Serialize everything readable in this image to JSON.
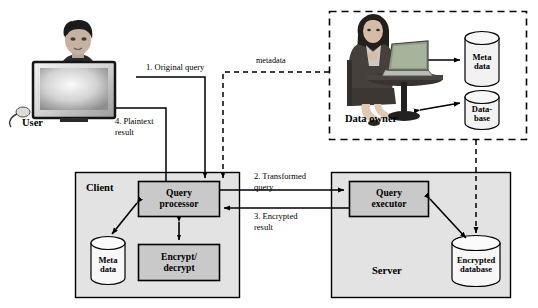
{
  "diagram": {
    "colors": {
      "zone_fill": "#e3e3e3",
      "component_fill": "#c9c9c9",
      "cylinder_fill": "#f2f2f2",
      "stroke": "#000000",
      "background": "#ffffff"
    },
    "actors": {
      "user": {
        "label": "User",
        "icon": "user-at-desktop-photo"
      },
      "data_owner": {
        "label": "Data owner",
        "icon": "woman-with-laptop-photo"
      }
    },
    "zones": [
      {
        "id": "data-owner-zone",
        "label": "",
        "border": "dashed"
      },
      {
        "id": "client-zone",
        "label": "Client",
        "border": "solid"
      },
      {
        "id": "server-zone",
        "label": "Server",
        "border": "solid"
      }
    ],
    "components": [
      {
        "id": "query-processor",
        "label": "Query\nprocessor",
        "zone": "client-zone"
      },
      {
        "id": "encrypt-decrypt",
        "label": "Encrypt/\ndecrypt",
        "zone": "client-zone"
      },
      {
        "id": "query-executor",
        "label": "Query\nexecutor",
        "zone": "server-zone"
      }
    ],
    "datastores": [
      {
        "id": "owner-meta-data",
        "label": "Meta\ndata",
        "zone": "data-owner-zone"
      },
      {
        "id": "owner-database",
        "label": "Data-\nbase",
        "zone": "data-owner-zone"
      },
      {
        "id": "client-meta-data",
        "label": "Meta\ndata",
        "zone": "client-zone"
      },
      {
        "id": "server-encrypted-database",
        "label": "Encrypted\ndatabase",
        "zone": "server-zone"
      }
    ],
    "flow_labels": {
      "step1": "1. Original query",
      "step2_line1": "2. Transformed",
      "step2_line2": "query",
      "step3_line1": "3. Encrypted",
      "step3_line2": "result",
      "step4_line1": "4. Plaintext",
      "step4_line2": "result",
      "metadata": "metadata"
    },
    "edges": [
      {
        "from": "user",
        "to": "query-processor",
        "label": "1. Original query",
        "style": "solid",
        "direction": "forward"
      },
      {
        "from": "query-processor",
        "to": "user",
        "label": "4. Plaintext result",
        "style": "solid",
        "direction": "forward"
      },
      {
        "from": "query-processor",
        "to": "query-executor",
        "label": "2. Transformed query",
        "style": "solid",
        "direction": "forward"
      },
      {
        "from": "query-executor",
        "to": "query-processor",
        "label": "3. Encrypted result",
        "style": "solid",
        "direction": "forward"
      },
      {
        "from": "data-owner-zone",
        "to": "query-processor",
        "label": "metadata",
        "style": "dashed",
        "direction": "forward"
      },
      {
        "from": "data-owner-zone",
        "to": "server-encrypted-database",
        "label": "",
        "style": "dashed",
        "direction": "forward"
      },
      {
        "from": "query-processor",
        "to": "client-meta-data",
        "label": "",
        "style": "solid",
        "direction": "both"
      },
      {
        "from": "query-processor",
        "to": "encrypt-decrypt",
        "label": "",
        "style": "solid",
        "direction": "both"
      },
      {
        "from": "query-executor",
        "to": "server-encrypted-database",
        "label": "",
        "style": "solid",
        "direction": "both"
      },
      {
        "from": "data-owner",
        "to": "owner-meta-data",
        "label": "",
        "style": "solid",
        "direction": "both"
      },
      {
        "from": "data-owner",
        "to": "owner-database",
        "label": "",
        "style": "solid",
        "direction": "both"
      }
    ]
  }
}
